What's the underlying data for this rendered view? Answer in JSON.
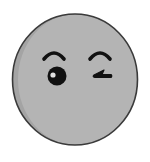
{
  "emoji": {
    "name": "winking face",
    "expression": "wink",
    "colors": {
      "background": "#ffffff",
      "face_fill": "#b4b4b4",
      "face_shade": "#a2a2a2",
      "outline": "#3a3a3a",
      "features": "#111111",
      "eye_highlight": "#e0e0e0"
    }
  }
}
